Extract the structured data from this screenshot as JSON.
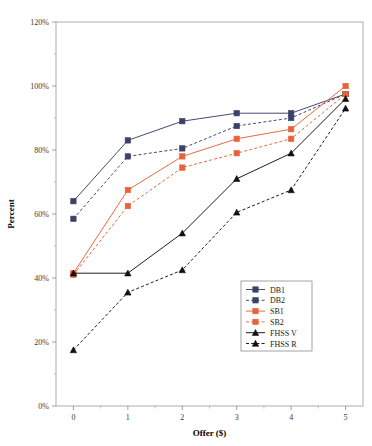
{
  "chart_data": {
    "type": "line",
    "title": "",
    "xlabel": "Offer ($)",
    "ylabel": "Percent",
    "x": [
      0,
      1,
      2,
      3,
      4,
      5
    ],
    "xticklabels": [
      "0",
      "1",
      "2",
      "3",
      "4",
      "5"
    ],
    "yticklabels": [
      "0%",
      "20%",
      "40%",
      "60%",
      "80%",
      "100%",
      "120%"
    ],
    "yticks": [
      0,
      20,
      40,
      60,
      80,
      100,
      120
    ],
    "xlim": [
      -0.32,
      5.32
    ],
    "ylim": [
      0,
      120
    ],
    "grid": false,
    "legend_position": "inside-lower-right",
    "series": [
      {
        "name": "DB1",
        "values": [
          64.0,
          83.0,
          89.0,
          91.5,
          91.5,
          97.5
        ],
        "color": "#3b4168",
        "dash": "solid",
        "marker": "square"
      },
      {
        "name": "DB2",
        "values": [
          58.5,
          78.0,
          80.5,
          87.5,
          90.0,
          97.5
        ],
        "color": "#3b4168",
        "dash": "dashed",
        "marker": "square"
      },
      {
        "name": "SB1",
        "values": [
          41.5,
          67.5,
          78.0,
          83.5,
          86.5,
          100.0
        ],
        "color": "#e8623a",
        "dash": "solid",
        "marker": "square"
      },
      {
        "name": "SB2",
        "values": [
          41.0,
          62.5,
          74.5,
          79.0,
          83.5,
          97.5
        ],
        "color": "#e8623a",
        "dash": "dashed",
        "marker": "square"
      },
      {
        "name": "FHSS V",
        "values": [
          41.5,
          41.5,
          54.0,
          71.0,
          79.0,
          96.0
        ],
        "color": "#111111",
        "dash": "solid",
        "marker": "triangle"
      },
      {
        "name": "FHSS R",
        "values": [
          17.5,
          35.5,
          42.5,
          60.5,
          67.5,
          93.0
        ],
        "color": "#111111",
        "dash": "dashed",
        "marker": "triangle"
      }
    ]
  }
}
